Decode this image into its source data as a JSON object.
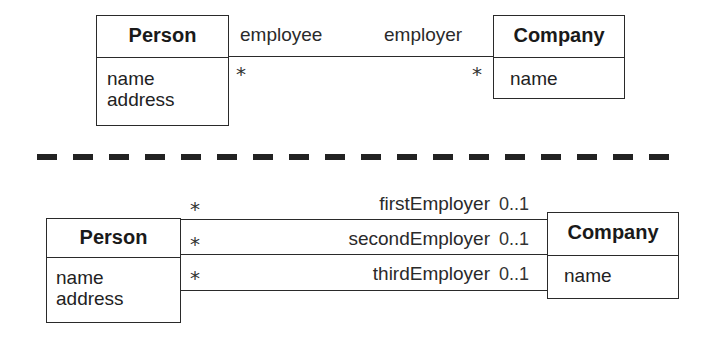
{
  "top_diagram": {
    "person": {
      "name": "Person",
      "attributes": [
        "name",
        "address"
      ]
    },
    "company": {
      "name": "Company",
      "attributes": [
        "name"
      ]
    },
    "association": {
      "person_role": "employee",
      "company_role": "employer",
      "person_multiplicity": "*",
      "company_multiplicity": "*"
    }
  },
  "separator": "dashed-line",
  "bottom_diagram": {
    "person": {
      "name": "Person",
      "attributes": [
        "name",
        "address"
      ]
    },
    "company": {
      "name": "Company",
      "attributes": [
        "name"
      ]
    },
    "associations": [
      {
        "role": "firstEmployer",
        "person_multiplicity": "*",
        "company_multiplicity": "0..1"
      },
      {
        "role": "secondEmployer",
        "person_multiplicity": "*",
        "company_multiplicity": "0..1"
      },
      {
        "role": "thirdEmployer",
        "person_multiplicity": "*",
        "company_multiplicity": "0..1"
      }
    ]
  },
  "colors": {
    "line": "#2a2a2a",
    "text": "#1e1e1e",
    "background": "#ffffff"
  }
}
